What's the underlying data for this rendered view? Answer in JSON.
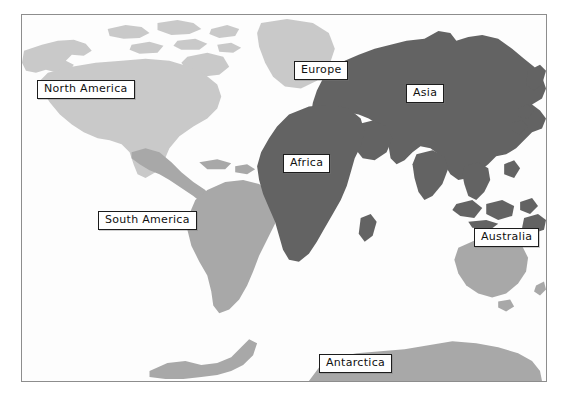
{
  "page": {
    "title_visible_fragment": "",
    "background_color": "#ffffff"
  },
  "map": {
    "frame_border_color": "#8d8d8d",
    "ocean_color": "#fdfdfd",
    "projection_note": "equirectangular world map"
  },
  "legend_colors": {
    "light_gray_land": "#c9c9c9",
    "medium_gray_land": "#a8a8a8",
    "dark_gray_land": "#636363",
    "label_box_background": "#ffffff",
    "label_box_border": "#1c1c1c",
    "label_text_color": "#101010"
  },
  "labels": [
    {
      "id": "north-america",
      "text": "North America",
      "shade": "light"
    },
    {
      "id": "south-america",
      "text": "South America",
      "shade": "medium"
    },
    {
      "id": "europe",
      "text": "Europe",
      "shade": "light"
    },
    {
      "id": "asia",
      "text": "Asia",
      "shade": "dark"
    },
    {
      "id": "africa",
      "text": "Africa",
      "shade": "dark"
    },
    {
      "id": "australia",
      "text": "Australia",
      "shade": "medium"
    },
    {
      "id": "antarctica",
      "text": "Antarctica",
      "shade": "medium"
    }
  ]
}
